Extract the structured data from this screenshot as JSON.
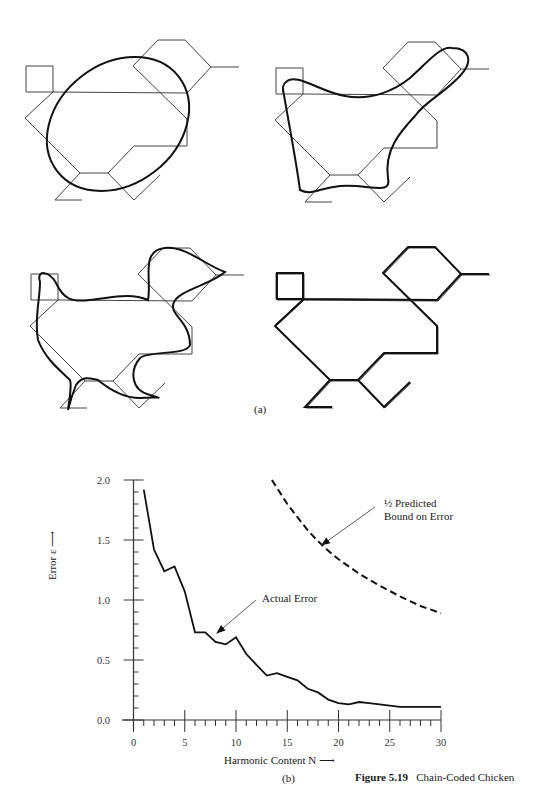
{
  "figure": {
    "number": "Figure 5.19",
    "title": "Chain-Coded Chicken",
    "panel_a_label": "(a)",
    "panel_b_label": "(b)"
  },
  "panel_a": {
    "description": "Chain-coded chicken outline with Fourier harmonic approximations of increasing order in four sub-panels",
    "subpanels": [
      "low-harmonic ellipse approximation",
      "few-harmonic approximation",
      "more harmonics approximation",
      "high-harmonic near-exact approximation"
    ]
  },
  "chart_data": {
    "type": "line",
    "title": "",
    "xlabel": "Harmonic Content N",
    "ylabel": "Error ε",
    "xlim": [
      0,
      30
    ],
    "ylim": [
      0,
      2.0
    ],
    "x_ticks": [
      "0",
      "5",
      "10",
      "15",
      "20",
      "25",
      "30"
    ],
    "y_ticks": [
      "0.0",
      "0.5",
      "1.0",
      "1.5",
      "2.0"
    ],
    "grid": false,
    "series": [
      {
        "name": "Actual Error",
        "style": "solid",
        "x": [
          1,
          2,
          3,
          4,
          5,
          6,
          7,
          8,
          9,
          10,
          11,
          12,
          13,
          14,
          15,
          16,
          17,
          18,
          19,
          20,
          21,
          22,
          23,
          24,
          25,
          26,
          27,
          28,
          29,
          30
        ],
        "values": [
          1.92,
          1.42,
          1.24,
          1.28,
          1.07,
          0.73,
          0.73,
          0.65,
          0.63,
          0.69,
          0.55,
          0.46,
          0.37,
          0.39,
          0.36,
          0.33,
          0.26,
          0.23,
          0.17,
          0.14,
          0.13,
          0.15,
          0.14,
          0.13,
          0.12,
          0.11,
          0.11,
          0.11,
          0.11,
          0.11
        ]
      },
      {
        "name": "½ Predicted Bound on Error",
        "style": "dashed",
        "x": [
          13.5,
          15,
          16,
          17,
          18,
          19,
          20,
          22,
          24,
          26,
          28,
          30
        ],
        "values": [
          2.0,
          1.8,
          1.69,
          1.58,
          1.49,
          1.41,
          1.34,
          1.22,
          1.12,
          1.03,
          0.95,
          0.89
        ]
      }
    ],
    "annotations": [
      {
        "text": "Actual Error",
        "arrow_to": [
          7.5,
          0.72
        ]
      },
      {
        "text": "½ Predicted Bound on Error",
        "arrow_to": [
          18,
          1.47
        ]
      }
    ]
  }
}
